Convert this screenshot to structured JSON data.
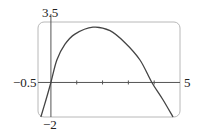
{
  "chart_data": {
    "type": "line",
    "title": "",
    "xlabel": "",
    "ylabel": "",
    "xlim": [
      -0.5,
      5
    ],
    "ylim": [
      -2,
      3.5
    ],
    "grid": false,
    "legend": null,
    "frame": "rounded-rectangle",
    "x_ticks": [
      1,
      2,
      3,
      4
    ],
    "tick_labels": {
      "x_min": "−0.5",
      "x_max": "5",
      "y_max": "3.5",
      "y_min": "−2"
    },
    "series": [
      {
        "name": "f(x)",
        "x": [
          -0.39,
          -0.19,
          0,
          0.23,
          0.54,
          0.93,
          1.63,
          2.29,
          2.87,
          3.45,
          3.91,
          4.34,
          4.73
        ],
        "y": [
          -2,
          -1,
          0,
          1.3,
          2.2,
          2.8,
          3.2,
          3.0,
          2.3,
          1.3,
          0,
          -1,
          -2
        ]
      }
    ]
  },
  "colors": {
    "frame": "#b8b8b8",
    "axes": "#555555",
    "curve": "#444444",
    "text": "#222222"
  }
}
